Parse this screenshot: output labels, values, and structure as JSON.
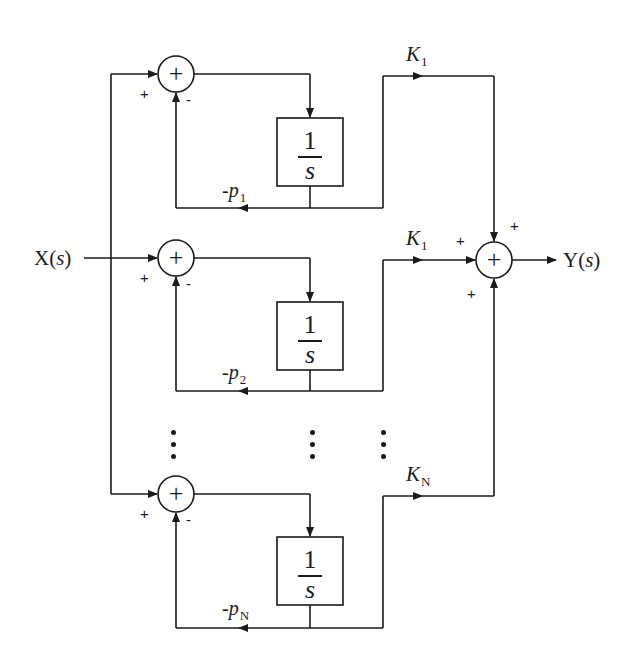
{
  "diagram": {
    "type": "block-diagram",
    "input": {
      "label": "X",
      "arg": "s"
    },
    "output": {
      "label": "Y",
      "arg": "s"
    },
    "branches": [
      {
        "id": "branch-1",
        "summer_signs": {
          "input": "+",
          "feedback": "-"
        },
        "block": {
          "numerator": "1",
          "denominator": "s"
        },
        "feedback_label": {
          "prefix": "-p",
          "sub": "1"
        },
        "gain_label": {
          "prefix": "K",
          "sub": "1"
        }
      },
      {
        "id": "branch-2",
        "summer_signs": {
          "input": "+",
          "feedback": "-"
        },
        "block": {
          "numerator": "1",
          "denominator": "s"
        },
        "feedback_label": {
          "prefix": "-p",
          "sub": "2"
        },
        "gain_label": {
          "prefix": "K",
          "sub": "1"
        }
      },
      {
        "id": "branch-N",
        "summer_signs": {
          "input": "+",
          "feedback": "-"
        },
        "block": {
          "numerator": "1",
          "denominator": "s"
        },
        "feedback_label": {
          "prefix": "-p",
          "sub": "N"
        },
        "gain_label": {
          "prefix": "K",
          "sub": "N"
        }
      }
    ],
    "summer_symbol": "+",
    "output_summer_signs": {
      "top": "+",
      "left": "+",
      "bottom": "+"
    },
    "ellipsis": "⋮",
    "colors": {
      "line": "#1a1a1a",
      "background": "#ffffff"
    }
  }
}
